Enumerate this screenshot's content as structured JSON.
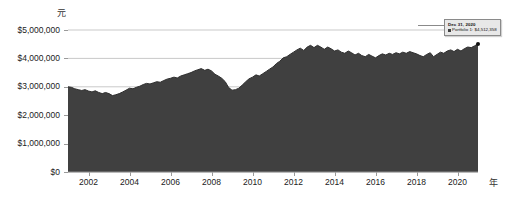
{
  "chart_data": {
    "type": "area",
    "title": "",
    "xlabel": "年",
    "ylabel": "元",
    "ylim": [
      0,
      5000000
    ],
    "xlim": [
      2001.0,
      2021.0
    ],
    "grid": true,
    "legend_position": "none",
    "series_name": "Portfolio 1",
    "series_color": "#404040",
    "y_ticks": [
      {
        "value": 5000000,
        "label": "$5,000,000"
      },
      {
        "value": 4000000,
        "label": "$4,000,000"
      },
      {
        "value": 3000000,
        "label": "$3,000,000"
      },
      {
        "value": 2000000,
        "label": "$2,000,000"
      },
      {
        "value": 1000000,
        "label": "$1,000,000"
      },
      {
        "value": 0,
        "label": "$0"
      }
    ],
    "x_ticks": [
      {
        "value": 2002,
        "label": "2002"
      },
      {
        "value": 2004,
        "label": "2004"
      },
      {
        "value": 2006,
        "label": "2006"
      },
      {
        "value": 2008,
        "label": "2008"
      },
      {
        "value": 2010,
        "label": "2010"
      },
      {
        "value": 2012,
        "label": "2012"
      },
      {
        "value": 2014,
        "label": "2014"
      },
      {
        "value": 2016,
        "label": "2016"
      },
      {
        "value": 2018,
        "label": "2018"
      },
      {
        "value": 2020,
        "label": "2020"
      }
    ],
    "x": [
      2001.0,
      2001.17,
      2001.33,
      2001.5,
      2001.67,
      2001.83,
      2002.0,
      2002.17,
      2002.33,
      2002.5,
      2002.67,
      2002.83,
      2003.0,
      2003.17,
      2003.33,
      2003.5,
      2003.67,
      2003.83,
      2004.0,
      2004.17,
      2004.33,
      2004.5,
      2004.67,
      2004.83,
      2005.0,
      2005.17,
      2005.33,
      2005.5,
      2005.67,
      2005.83,
      2006.0,
      2006.17,
      2006.33,
      2006.5,
      2006.67,
      2006.83,
      2007.0,
      2007.17,
      2007.33,
      2007.5,
      2007.67,
      2007.83,
      2008.0,
      2008.17,
      2008.33,
      2008.5,
      2008.67,
      2008.83,
      2009.0,
      2009.17,
      2009.33,
      2009.5,
      2009.67,
      2009.83,
      2010.0,
      2010.17,
      2010.33,
      2010.5,
      2010.67,
      2010.83,
      2011.0,
      2011.17,
      2011.33,
      2011.5,
      2011.67,
      2011.83,
      2012.0,
      2012.17,
      2012.33,
      2012.5,
      2012.67,
      2012.83,
      2013.0,
      2013.17,
      2013.33,
      2013.5,
      2013.67,
      2013.83,
      2014.0,
      2014.17,
      2014.33,
      2014.5,
      2014.67,
      2014.83,
      2015.0,
      2015.17,
      2015.33,
      2015.5,
      2015.67,
      2015.83,
      2016.0,
      2016.17,
      2016.33,
      2016.5,
      2016.67,
      2016.83,
      2017.0,
      2017.17,
      2017.33,
      2017.5,
      2017.67,
      2017.83,
      2018.0,
      2018.17,
      2018.33,
      2018.5,
      2018.67,
      2018.83,
      2019.0,
      2019.17,
      2019.33,
      2019.5,
      2019.67,
      2019.83,
      2020.0,
      2020.17,
      2020.33,
      2020.5,
      2020.67,
      2020.83,
      2021.0
    ],
    "values": [
      3000000,
      2980000,
      2930000,
      2900000,
      2870000,
      2900000,
      2850000,
      2820000,
      2860000,
      2800000,
      2760000,
      2800000,
      2760000,
      2690000,
      2720000,
      2760000,
      2820000,
      2880000,
      2950000,
      2930000,
      2980000,
      3020000,
      3080000,
      3120000,
      3100000,
      3140000,
      3180000,
      3160000,
      3220000,
      3270000,
      3300000,
      3340000,
      3310000,
      3380000,
      3420000,
      3460000,
      3500000,
      3560000,
      3600000,
      3640000,
      3580000,
      3620000,
      3560000,
      3440000,
      3380000,
      3300000,
      3180000,
      2980000,
      2880000,
      2900000,
      2950000,
      3060000,
      3180000,
      3280000,
      3340000,
      3420000,
      3380000,
      3460000,
      3540000,
      3620000,
      3700000,
      3820000,
      3900000,
      4020000,
      4060000,
      4140000,
      4220000,
      4300000,
      4360000,
      4280000,
      4400000,
      4460000,
      4380000,
      4460000,
      4400000,
      4320000,
      4400000,
      4340000,
      4260000,
      4300000,
      4220000,
      4180000,
      4260000,
      4200000,
      4120000,
      4180000,
      4100000,
      4060000,
      4140000,
      4080000,
      4020000,
      4100000,
      4160000,
      4120000,
      4180000,
      4140000,
      4200000,
      4160000,
      4220000,
      4180000,
      4240000,
      4200000,
      4160000,
      4100000,
      4060000,
      4140000,
      4200000,
      4060000,
      4140000,
      4220000,
      4180000,
      4260000,
      4300000,
      4240000,
      4320000,
      4260000,
      4340000,
      4400000,
      4380000,
      4440000,
      4512358
    ],
    "annotation": {
      "date": "Dec 31, 2020",
      "series_label": "Portfolio 1:",
      "value_label": "$4,512,358",
      "point_x": 2021.0,
      "point_y": 4512358
    }
  }
}
